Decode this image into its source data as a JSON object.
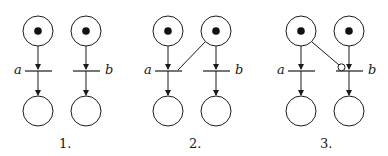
{
  "diagram": {
    "type": "petri-net-comparison",
    "panels": [
      {
        "caption": "1.",
        "transitions": [
          {
            "label": "a"
          },
          {
            "label": "b"
          }
        ],
        "description": "Two independent nets, each with a marked input place, transition, and empty output place"
      },
      {
        "caption": "2.",
        "transitions": [
          {
            "label": "a"
          },
          {
            "label": "b"
          }
        ],
        "description": "Additional arc from right input place to transition a (conflict)"
      },
      {
        "caption": "3.",
        "transitions": [
          {
            "label": "a"
          },
          {
            "label": "b"
          }
        ],
        "description": "Inhibitor arc from left input place to transition b"
      }
    ],
    "colors": {
      "stroke": "#1a1a1a",
      "token": "#111111",
      "background": "#ffffff"
    }
  }
}
